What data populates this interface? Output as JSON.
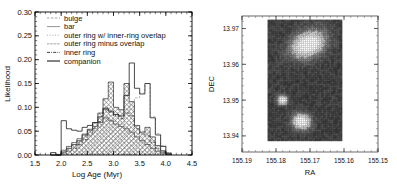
{
  "figure": {
    "panels": [
      "likelihood-histogram",
      "sky-image"
    ]
  },
  "chart_data": [
    {
      "type": "bar",
      "title": "",
      "xlabel": "Log Age (Myr)",
      "ylabel": "Likelihood",
      "xlim": [
        1.5,
        4.5
      ],
      "ylim": [
        0.0,
        0.3
      ],
      "xticks": [
        "1.5",
        "2.0",
        "2.5",
        "3.0",
        "3.5",
        "4.0",
        "4.5"
      ],
      "yticks": [
        "0.00",
        "0.05",
        "0.10",
        "0.15",
        "0.20",
        "0.25",
        "0.30"
      ],
      "grid": false,
      "legend_position": "top-left",
      "bin_width": 0.1,
      "x": [
        1.85,
        1.95,
        2.05,
        2.15,
        2.25,
        2.35,
        2.45,
        2.55,
        2.65,
        2.75,
        2.85,
        2.95,
        3.05,
        3.15,
        3.25,
        3.35,
        3.45,
        3.55,
        3.65,
        3.75,
        3.85,
        3.95,
        4.05
      ],
      "series": [
        {
          "name": "bulge",
          "style": "dashed-line",
          "values": [
            0.0,
            0.0,
            0.005,
            0.01,
            0.015,
            0.02,
            0.03,
            0.04,
            0.05,
            0.06,
            0.08,
            0.075,
            0.07,
            0.065,
            0.09,
            0.11,
            0.12,
            0.13,
            0.15,
            0.08,
            0.045,
            0.02,
            0.005
          ]
        },
        {
          "name": "bar",
          "style": "solid-line",
          "values": [
            0.005,
            0.0,
            0.072,
            0.055,
            0.052,
            0.05,
            0.058,
            0.062,
            0.068,
            0.08,
            0.098,
            0.092,
            0.085,
            0.082,
            0.125,
            0.193,
            0.14,
            0.128,
            0.15,
            0.078,
            0.042,
            0.018,
            0.004
          ]
        },
        {
          "name": "outer ring w/ inner-ring overlap",
          "style": "dotted-line",
          "values": [
            0.0,
            0.002,
            0.008,
            0.012,
            0.02,
            0.028,
            0.038,
            0.048,
            0.06,
            0.075,
            0.1,
            0.095,
            0.088,
            0.08,
            0.095,
            0.105,
            0.06,
            0.05,
            0.048,
            0.03,
            0.016,
            0.008,
            0.002
          ]
        },
        {
          "name": "outer ring minus overlap",
          "style": "hatch-diagonal",
          "values": [
            0.0,
            0.0,
            0.01,
            0.018,
            0.026,
            0.034,
            0.044,
            0.052,
            0.06,
            0.068,
            0.078,
            0.072,
            0.065,
            0.06,
            0.055,
            0.048,
            0.038,
            0.03,
            0.022,
            0.014,
            0.008,
            0.004,
            0.001
          ]
        },
        {
          "name": "inner ring",
          "style": "dash-dot-line",
          "values": [
            0.0,
            0.0,
            0.004,
            0.008,
            0.014,
            0.022,
            0.032,
            0.042,
            0.055,
            0.07,
            0.095,
            0.09,
            0.082,
            0.076,
            0.088,
            0.082,
            0.055,
            0.044,
            0.04,
            0.026,
            0.014,
            0.006,
            0.002
          ]
        },
        {
          "name": "companion",
          "style": "hatch-cross",
          "values": [
            0.0,
            0.0,
            0.006,
            0.014,
            0.022,
            0.03,
            0.042,
            0.054,
            0.068,
            0.088,
            0.118,
            0.153,
            0.1,
            0.095,
            0.15,
            0.112,
            0.062,
            0.048,
            0.058,
            0.038,
            0.02,
            0.009,
            0.002
          ]
        }
      ],
      "legend": [
        {
          "label": "bulge",
          "style": "dashed-line"
        },
        {
          "label": "bar",
          "style": "solid-line"
        },
        {
          "label": "outer ring w/ inner-ring overlap",
          "style": "dotted-line"
        },
        {
          "label": "outer ring minus overlap",
          "style": "hatch-diagonal"
        },
        {
          "label": "inner ring",
          "style": "dash-dot-line"
        },
        {
          "label": "companion",
          "style": "solid-line-thick"
        }
      ]
    },
    {
      "type": "heatmap",
      "title": "",
      "xlabel": "RA",
      "ylabel": "DEC",
      "xlim": [
        155.19,
        155.15
      ],
      "ylim": [
        13.9355,
        13.9735
      ],
      "xticks": [
        "155.19",
        "155.18",
        "155.17",
        "155.16",
        "155.15"
      ],
      "yticks": [
        "13.94",
        "13.95",
        "13.96",
        "13.97"
      ],
      "grid": false,
      "colormap": "greyscale",
      "image_extent": {
        "ra_min": 155.1825,
        "ra_max": 155.1605,
        "dec_min": 13.9385,
        "dec_max": 13.9725
      },
      "sources": [
        {
          "name": "north-extended-clump",
          "ra": 155.1705,
          "dec": 13.9655,
          "rx": 0.0048,
          "ry": 0.0032,
          "angle": -25,
          "peak": 1.0,
          "contoured": true
        },
        {
          "name": "mid-compact-source",
          "ra": 155.178,
          "dec": 13.95,
          "rx": 0.0014,
          "ry": 0.0012,
          "angle": 0,
          "peak": 0.85,
          "contoured": true
        },
        {
          "name": "south-bright-source",
          "ra": 155.1725,
          "dec": 13.944,
          "rx": 0.0024,
          "ry": 0.002,
          "angle": 10,
          "peak": 1.0,
          "contoured": true
        }
      ]
    }
  ]
}
